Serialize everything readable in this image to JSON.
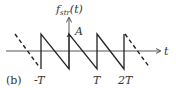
{
  "diagram": {
    "panel_label": "(b)",
    "y_axis_label": "f",
    "y_axis_subscript": "str",
    "y_axis_arg": "(t)",
    "x_axis_label": "t",
    "amplitude_label": "A",
    "tick_labels": [
      "-T",
      "T",
      "2T"
    ],
    "waveform": "sawtooth",
    "colors": {
      "line": "#222222",
      "axis": "#444444",
      "text": "#333333"
    }
  }
}
